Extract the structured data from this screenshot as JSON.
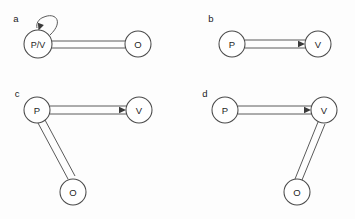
{
  "figure": {
    "title": "",
    "background_color": "#fdfdfd",
    "node_stroke_color": "#4a4a4a",
    "edge_stroke_color": "#5a5a5a",
    "text_color": "#1f1f1f",
    "width": 355,
    "height": 219
  },
  "panels": [
    {
      "id": "a",
      "label": "a",
      "label_x": 16,
      "label_y": 18,
      "nodes": [
        {
          "id": "pv",
          "label": "P/V",
          "cx": 38,
          "cy": 44,
          "r": 14,
          "wide": true
        },
        {
          "id": "o",
          "label": "O",
          "cx": 138,
          "cy": 44,
          "r": 13,
          "wide": false
        }
      ],
      "edges": [
        {
          "from": "pv",
          "to": "o",
          "style": "double-line",
          "arrow": false,
          "x1": 51,
          "y1": 41,
          "x2": 125,
          "y2": 41,
          "x1b": 51,
          "y1b": 48,
          "x2b": 125,
          "y2b": 48
        }
      ],
      "self_loops": [
        {
          "node": "pv",
          "arrow": true,
          "arrow_direction": "down-left",
          "path": "M 50 35 C 64 22 56 12 44 17 C 38 19 36 24 37 28",
          "arrow_x": 38.5,
          "arrow_y": 30.5,
          "arrow_angle": 110
        }
      ]
    },
    {
      "id": "b",
      "label": "b",
      "label_x": 211,
      "label_y": 18,
      "nodes": [
        {
          "id": "p",
          "label": "P",
          "cx": 232,
          "cy": 44,
          "r": 13,
          "wide": false
        },
        {
          "id": "v",
          "label": "V",
          "cx": 318,
          "cy": 44,
          "r": 13,
          "wide": false
        }
      ],
      "edges": [
        {
          "from": "p",
          "to": "v",
          "style": "double-line",
          "arrow": true,
          "x1": 245,
          "y1": 40,
          "x2": 306,
          "y2": 40,
          "x1b": 245,
          "y1b": 48,
          "x2b": 306,
          "y2b": 48,
          "arrow_x": 305,
          "arrow_y": 44,
          "arrow_angle": 0
        }
      ],
      "self_loops": []
    },
    {
      "id": "c",
      "label": "c",
      "label_x": 17,
      "label_y": 93,
      "nodes": [
        {
          "id": "p",
          "label": "P",
          "cx": 37,
          "cy": 110,
          "r": 13,
          "wide": false
        },
        {
          "id": "v",
          "label": "V",
          "cx": 139,
          "cy": 110,
          "r": 13,
          "wide": false
        },
        {
          "id": "o",
          "label": "O",
          "cx": 73,
          "cy": 192,
          "r": 13,
          "wide": false
        }
      ],
      "edges": [
        {
          "from": "p",
          "to": "v",
          "style": "double-line",
          "arrow": true,
          "x1": 50,
          "y1": 106,
          "x2": 127,
          "y2": 106,
          "x1b": 50,
          "y1b": 114,
          "x2b": 127,
          "y2b": 114,
          "arrow_x": 126,
          "arrow_y": 110,
          "arrow_angle": 0
        },
        {
          "from": "p",
          "to": "o",
          "style": "double-line",
          "arrow": false,
          "x1": 38,
          "y1": 123,
          "x2": 68,
          "y2": 179,
          "x1b": 45,
          "y1b": 120,
          "x2b": 75,
          "y2b": 176
        }
      ],
      "self_loops": []
    },
    {
      "id": "d",
      "label": "d",
      "label_x": 205,
      "label_y": 93,
      "nodes": [
        {
          "id": "p",
          "label": "P",
          "cx": 225,
          "cy": 110,
          "r": 13,
          "wide": false
        },
        {
          "id": "v",
          "label": "V",
          "cx": 324,
          "cy": 110,
          "r": 13,
          "wide": false
        },
        {
          "id": "o",
          "label": "O",
          "cx": 297,
          "cy": 192,
          "r": 13,
          "wide": false
        }
      ],
      "edges": [
        {
          "from": "p",
          "to": "v",
          "style": "double-line",
          "arrow": true,
          "x1": 238,
          "y1": 106,
          "x2": 312,
          "y2": 106,
          "x1b": 238,
          "y1b": 114,
          "x2b": 312,
          "y2b": 114,
          "arrow_x": 311,
          "arrow_y": 110,
          "arrow_angle": 0
        },
        {
          "from": "v",
          "to": "o",
          "style": "double-line",
          "arrow": false,
          "x1": 318,
          "y1": 122,
          "x2": 295,
          "y2": 179,
          "x1b": 325,
          "y1b": 124,
          "x2b": 302,
          "y2b": 180
        }
      ],
      "self_loops": []
    }
  ]
}
